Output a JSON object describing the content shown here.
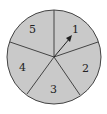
{
  "diagram": {
    "type": "spinner",
    "sections": [
      {
        "label": "1"
      },
      {
        "label": "2"
      },
      {
        "label": "3"
      },
      {
        "label": "4"
      },
      {
        "label": "5"
      }
    ],
    "pointer_target": "1",
    "colors": {
      "fill": "#c9c9c9",
      "stroke": "#444444",
      "label": "#222222"
    }
  }
}
